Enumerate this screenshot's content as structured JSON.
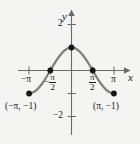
{
  "figure": {
    "background_color": "#f4f4f3",
    "curve_color": "#808080",
    "axis_color": "#6b6b6b",
    "point_color": "#161616",
    "text_color": "#1a1a1a"
  },
  "axes": {
    "x_axis_label": "x",
    "y_axis_label": "y",
    "x_ticks": [
      {
        "value": -3.14159,
        "label": "−π",
        "kind": "plain"
      },
      {
        "value": -1.5708,
        "label": "−π/2",
        "kind": "fraction",
        "sign": "−",
        "numerator": "π",
        "denominator": "2"
      },
      {
        "value": 1.5708,
        "label": "π/2",
        "kind": "fraction",
        "sign": "",
        "numerator": "π",
        "denominator": "2"
      },
      {
        "value": 3.14159,
        "label": "π",
        "kind": "plain"
      }
    ],
    "y_ticks": [
      {
        "value": 2,
        "label": "2"
      },
      {
        "value": -2,
        "label": "−2"
      }
    ],
    "xlim": [
      -4.2,
      4.2
    ],
    "ylim": [
      -2.6,
      2.6
    ]
  },
  "annotations": [
    {
      "name": "left-endpoint-label",
      "text": "(−π, −1)",
      "x": -3.14159,
      "y": -1
    },
    {
      "name": "right-endpoint-label",
      "text": "(π, −1)",
      "x": 3.14159,
      "y": -1
    }
  ],
  "chart_data": {
    "type": "line",
    "title": "",
    "xlabel": "x",
    "ylabel": "y",
    "function": "y = cos(x)",
    "xlim": [
      -4.2,
      4.2
    ],
    "ylim": [
      -2.6,
      2.6
    ],
    "grid": false,
    "legend": "none",
    "series": [
      {
        "name": "y = cos(x)",
        "color": "#808080",
        "x": [
          -3.14159,
          -2.9452,
          -2.7489,
          -2.5525,
          -2.3562,
          -2.1598,
          -1.9635,
          -1.7671,
          -1.5708,
          -1.3744,
          -1.1781,
          -0.9817,
          -0.7854,
          -0.589,
          -0.3927,
          -0.1963,
          0,
          0.1963,
          0.3927,
          0.589,
          0.7854,
          0.9817,
          1.1781,
          1.3744,
          1.5708,
          1.7671,
          1.9635,
          2.1598,
          2.3562,
          2.5525,
          2.7489,
          2.9452,
          3.14159
        ],
        "y": [
          -1,
          -0.9808,
          -0.9239,
          -0.8315,
          -0.7071,
          -0.5556,
          -0.3827,
          -0.1951,
          0,
          0.1951,
          0.3827,
          0.5556,
          0.7071,
          0.8315,
          0.9239,
          0.9808,
          1,
          0.9808,
          0.9239,
          0.8315,
          0.7071,
          0.5556,
          0.3827,
          0.1951,
          0,
          -0.1951,
          -0.3827,
          -0.5556,
          -0.7071,
          -0.8315,
          -0.9239,
          -0.9808,
          -1
        ]
      }
    ],
    "marked_points": [
      {
        "x": -3.14159,
        "y": -1,
        "label": "(−π, −1)"
      },
      {
        "x": -1.5708,
        "y": 0,
        "label": ""
      },
      {
        "x": 0,
        "y": 1,
        "label": ""
      },
      {
        "x": 1.5708,
        "y": 0,
        "label": ""
      },
      {
        "x": 3.14159,
        "y": -1,
        "label": "(π, −1)"
      }
    ],
    "xticks": [
      -3.14159,
      -1.5708,
      1.5708,
      3.14159
    ],
    "xticklabels": [
      "−π",
      "−π/2",
      "π/2",
      "π"
    ],
    "yticks": [
      2,
      -2
    ],
    "yticklabels": [
      "2",
      "−2"
    ]
  }
}
